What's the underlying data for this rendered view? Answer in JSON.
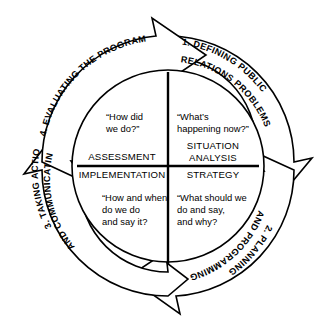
{
  "diagram": {
    "direction": "clockwise",
    "colors": {
      "background": "#ffffff",
      "stroke": "#000000",
      "text": "#000000"
    },
    "stages": [
      {
        "number": "1.",
        "label_line1": "1. DEFINING PUBLIC",
        "label_line2": "RELATIONS PROBLEMS",
        "position": "top-right"
      },
      {
        "number": "2.",
        "label_line1": "2. PLANNING",
        "label_line2": "AND PROGRAMMING",
        "position": "bottom-right"
      },
      {
        "number": "3.",
        "label_line1": "3. TAKING ACTION",
        "label_line2": "AND COMMUNICATING",
        "position": "bottom-left"
      },
      {
        "number": "4.",
        "label_line1": "4. EVALUATING THE PROGRAM",
        "label_line2": "",
        "position": "top-left"
      }
    ],
    "quadrants": [
      {
        "id": "situation-analysis",
        "position": "top-right",
        "question_line1": "“What’s",
        "question_line2": "happening now?”",
        "label_line1": "SITUATION",
        "label_line2": "ANALYSIS"
      },
      {
        "id": "strategy",
        "position": "bottom-right",
        "question_line1": "“What should we",
        "question_line2": "do and say,",
        "question_line3": "and why?",
        "label_line1": "STRATEGY",
        "label_line2": ""
      },
      {
        "id": "implementation",
        "position": "bottom-left",
        "question_line1": "“How and when",
        "question_line2": "do we do",
        "question_line3": "and say it?",
        "label_line1": "IMPLEMENTATION",
        "label_line2": ""
      },
      {
        "id": "assessment",
        "position": "top-left",
        "question_line1": "“How did",
        "question_line2": "we do?”",
        "label_line1": "ASSESSMENT",
        "label_line2": ""
      }
    ]
  }
}
